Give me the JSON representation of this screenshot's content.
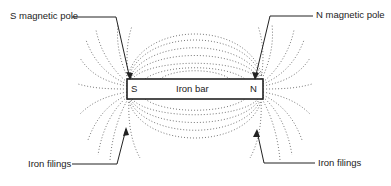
{
  "diagram": {
    "bar": {
      "label": "Iron bar",
      "left_pole": "S",
      "right_pole": "N"
    },
    "callouts": {
      "top_left": "S magnetic pole",
      "top_right": "N magnetic pole",
      "bottom_left": "Iron filings",
      "bottom_right": "Iron filings"
    },
    "colors": {
      "ink": "#222222",
      "filings": "#555555",
      "background": "#ffffff"
    }
  }
}
